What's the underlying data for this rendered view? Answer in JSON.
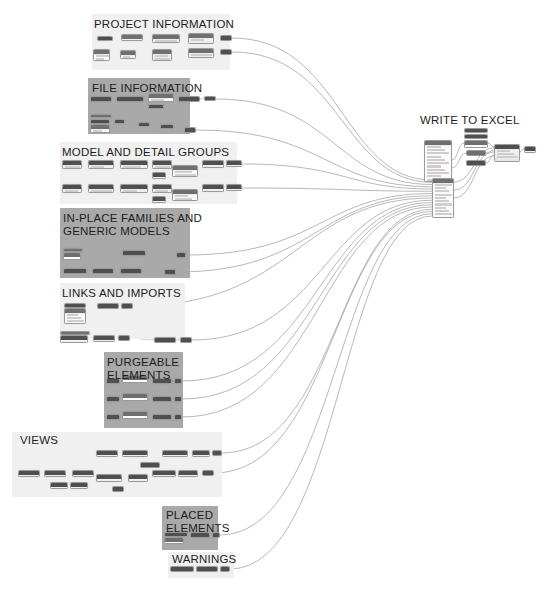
{
  "app": {
    "kind": "dynamo-visual-programming-graph",
    "canvas_width": 548,
    "canvas_height": 604,
    "background_color": "#ffffff",
    "wire_color": "#9a9a9a",
    "node_header_color": "#4f4f4f",
    "node_body_color": "#eceaea",
    "group_light_color": "#f0f0f0",
    "group_dark_color": "#a9a9a9",
    "title_color": "#1d1d1d"
  },
  "groups": [
    {
      "id": "project-information",
      "title": "PROJECT INFORMATION",
      "shade": "light",
      "x": 92,
      "y": 14,
      "w": 138,
      "h": 56,
      "title_x": 94,
      "title_y": 18
    },
    {
      "id": "file-information",
      "title": "FILE INFORMATION",
      "shade": "dark",
      "x": 88,
      "y": 78,
      "w": 102,
      "h": 56,
      "title_x": 92,
      "title_y": 82
    },
    {
      "id": "model-and-detail-groups",
      "title": "MODEL AND DETAIL GROUPS",
      "shade": "light",
      "x": 60,
      "y": 142,
      "w": 177,
      "h": 62,
      "title_x": 62,
      "title_y": 146
    },
    {
      "id": "in-place-families",
      "title": "IN-PLACE FAMILIES AND\nGENERIC MODELS",
      "shade": "dark",
      "x": 60,
      "y": 208,
      "w": 130,
      "h": 70,
      "title_x": 63,
      "title_y": 212
    },
    {
      "id": "links-and-imports",
      "title": "LINKS AND IMPORTS",
      "shade": "light",
      "x": 60,
      "y": 283,
      "w": 125,
      "h": 56,
      "title_x": 62,
      "title_y": 287
    },
    {
      "id": "purgeable-elements",
      "title": "PURGEABLE\nELEMENTS",
      "shade": "dark",
      "x": 104,
      "y": 352,
      "w": 79,
      "h": 76,
      "title_x": 107,
      "title_y": 356
    },
    {
      "id": "views",
      "title": "VIEWS",
      "shade": "light",
      "x": 12,
      "y": 432,
      "w": 210,
      "h": 65,
      "title_x": 20,
      "title_y": 434
    },
    {
      "id": "placed-elements",
      "title": "PLACED\nELEMENTS",
      "shade": "dark",
      "x": 162,
      "y": 506,
      "w": 56,
      "h": 44,
      "title_x": 166,
      "title_y": 509
    },
    {
      "id": "warnings",
      "title": "WARNINGS",
      "shade": "light",
      "x": 168,
      "y": 552,
      "w": 66,
      "h": 26,
      "title_x": 172,
      "title_y": 553
    },
    {
      "id": "write-to-excel",
      "title": "WRITE TO EXCEL",
      "shade": "none",
      "x": 418,
      "y": 112,
      "w": 120,
      "h": 96,
      "title_x": 420,
      "title_y": 114
    }
  ],
  "nodes": [
    {
      "g": "project-information",
      "x": 97,
      "y": 36,
      "w": 16,
      "h": 5,
      "k": "dark"
    },
    {
      "g": "project-information",
      "x": 121,
      "y": 34,
      "w": 22,
      "h": 7,
      "k": "std"
    },
    {
      "g": "project-information",
      "x": 152,
      "y": 34,
      "w": 28,
      "h": 9,
      "k": "std"
    },
    {
      "g": "project-information",
      "x": 188,
      "y": 33,
      "w": 26,
      "h": 11,
      "k": "std"
    },
    {
      "g": "project-information",
      "x": 220,
      "y": 35,
      "w": 12,
      "h": 6,
      "k": "dark"
    },
    {
      "g": "project-information",
      "x": 93,
      "y": 49,
      "w": 17,
      "h": 12,
      "k": "white"
    },
    {
      "g": "project-information",
      "x": 120,
      "y": 50,
      "w": 16,
      "h": 9,
      "k": "std"
    },
    {
      "g": "project-information",
      "x": 152,
      "y": 49,
      "w": 20,
      "h": 12,
      "k": "std"
    },
    {
      "g": "project-information",
      "x": 188,
      "y": 48,
      "w": 26,
      "h": 10,
      "k": "std"
    },
    {
      "g": "project-information",
      "x": 220,
      "y": 49,
      "w": 12,
      "h": 6,
      "k": "dark"
    },
    {
      "g": "file-information",
      "x": 90,
      "y": 96,
      "w": 22,
      "h": 6,
      "k": "dark"
    },
    {
      "g": "file-information",
      "x": 116,
      "y": 96,
      "w": 28,
      "h": 6,
      "k": "dark"
    },
    {
      "g": "file-information",
      "x": 148,
      "y": 93,
      "w": 26,
      "h": 9,
      "k": "white"
    },
    {
      "g": "file-information",
      "x": 148,
      "y": 104,
      "w": 16,
      "h": 5,
      "k": "dark"
    },
    {
      "g": "file-information",
      "x": 178,
      "y": 96,
      "w": 22,
      "h": 6,
      "k": "dark"
    },
    {
      "g": "file-information",
      "x": 204,
      "y": 96,
      "w": 12,
      "h": 5,
      "k": "dark"
    },
    {
      "g": "file-information",
      "x": 90,
      "y": 114,
      "w": 22,
      "h": 4,
      "k": "white"
    },
    {
      "g": "file-information",
      "x": 90,
      "y": 119,
      "w": 20,
      "h": 5,
      "k": "dark"
    },
    {
      "g": "file-information",
      "x": 90,
      "y": 124,
      "w": 20,
      "h": 9,
      "k": "white"
    },
    {
      "g": "file-information",
      "x": 114,
      "y": 119,
      "w": 11,
      "h": 5,
      "k": "dark"
    },
    {
      "g": "file-information",
      "x": 138,
      "y": 122,
      "w": 12,
      "h": 5,
      "k": "dark"
    },
    {
      "g": "file-information",
      "x": 160,
      "y": 124,
      "w": 14,
      "h": 5,
      "k": "dark"
    },
    {
      "g": "file-information",
      "x": 184,
      "y": 127,
      "w": 12,
      "h": 6,
      "k": "dark"
    },
    {
      "g": "model-and-detail-groups",
      "x": 62,
      "y": 160,
      "w": 20,
      "h": 9,
      "k": "dark"
    },
    {
      "g": "model-and-detail-groups",
      "x": 88,
      "y": 160,
      "w": 26,
      "h": 9,
      "k": "dark"
    },
    {
      "g": "model-and-detail-groups",
      "x": 120,
      "y": 160,
      "w": 28,
      "h": 9,
      "k": "dark"
    },
    {
      "g": "model-and-detail-groups",
      "x": 152,
      "y": 160,
      "w": 20,
      "h": 9,
      "k": "dark"
    },
    {
      "g": "model-and-detail-groups",
      "x": 152,
      "y": 172,
      "w": 14,
      "h": 7,
      "k": "dark"
    },
    {
      "g": "model-and-detail-groups",
      "x": 172,
      "y": 165,
      "w": 26,
      "h": 12,
      "k": "white"
    },
    {
      "g": "model-and-detail-groups",
      "x": 202,
      "y": 160,
      "w": 22,
      "h": 8,
      "k": "dark"
    },
    {
      "g": "model-and-detail-groups",
      "x": 226,
      "y": 160,
      "w": 16,
      "h": 7,
      "k": "dark"
    },
    {
      "g": "model-and-detail-groups",
      "x": 62,
      "y": 184,
      "w": 20,
      "h": 9,
      "k": "dark"
    },
    {
      "g": "model-and-detail-groups",
      "x": 88,
      "y": 184,
      "w": 26,
      "h": 9,
      "k": "dark"
    },
    {
      "g": "model-and-detail-groups",
      "x": 120,
      "y": 184,
      "w": 28,
      "h": 9,
      "k": "dark"
    },
    {
      "g": "model-and-detail-groups",
      "x": 152,
      "y": 184,
      "w": 20,
      "h": 9,
      "k": "dark"
    },
    {
      "g": "model-and-detail-groups",
      "x": 152,
      "y": 196,
      "w": 14,
      "h": 7,
      "k": "dark"
    },
    {
      "g": "model-and-detail-groups",
      "x": 172,
      "y": 189,
      "w": 26,
      "h": 12,
      "k": "white"
    },
    {
      "g": "model-and-detail-groups",
      "x": 202,
      "y": 184,
      "w": 22,
      "h": 8,
      "k": "dark"
    },
    {
      "g": "model-and-detail-groups",
      "x": 226,
      "y": 184,
      "w": 16,
      "h": 7,
      "k": "dark"
    },
    {
      "g": "in-place-families",
      "x": 63,
      "y": 248,
      "w": 20,
      "h": 4,
      "k": "white"
    },
    {
      "g": "in-place-families",
      "x": 63,
      "y": 252,
      "w": 18,
      "h": 8,
      "k": "white"
    },
    {
      "g": "in-place-families",
      "x": 122,
      "y": 250,
      "w": 24,
      "h": 6,
      "k": "dark"
    },
    {
      "g": "in-place-families",
      "x": 176,
      "y": 252,
      "w": 10,
      "h": 6,
      "k": "dark"
    },
    {
      "g": "in-place-families",
      "x": 63,
      "y": 268,
      "w": 24,
      "h": 6,
      "k": "dark"
    },
    {
      "g": "in-place-families",
      "x": 92,
      "y": 268,
      "w": 22,
      "h": 6,
      "k": "dark"
    },
    {
      "g": "in-place-families",
      "x": 120,
      "y": 268,
      "w": 22,
      "h": 6,
      "k": "dark"
    },
    {
      "g": "in-place-families",
      "x": 164,
      "y": 269,
      "w": 12,
      "h": 6,
      "k": "dark"
    },
    {
      "g": "links-and-imports",
      "x": 64,
      "y": 303,
      "w": 22,
      "h": 5,
      "k": "dark"
    },
    {
      "g": "links-and-imports",
      "x": 64,
      "y": 308,
      "w": 22,
      "h": 16,
      "k": "white"
    },
    {
      "g": "links-and-imports",
      "x": 97,
      "y": 303,
      "w": 22,
      "h": 6,
      "k": "dark"
    },
    {
      "g": "links-and-imports",
      "x": 121,
      "y": 303,
      "w": 12,
      "h": 6,
      "k": "dark"
    },
    {
      "g": "links-and-imports",
      "x": 60,
      "y": 331,
      "w": 30,
      "h": 4,
      "k": "white"
    },
    {
      "g": "links-and-imports",
      "x": 60,
      "y": 335,
      "w": 28,
      "h": 8,
      "k": "dark"
    },
    {
      "g": "links-and-imports",
      "x": 93,
      "y": 335,
      "w": 22,
      "h": 7,
      "k": "dark"
    },
    {
      "g": "links-and-imports",
      "x": 118,
      "y": 335,
      "w": 12,
      "h": 6,
      "k": "dark"
    },
    {
      "g": "links-and-imports",
      "x": 154,
      "y": 337,
      "w": 22,
      "h": 6,
      "k": "dark"
    },
    {
      "g": "links-and-imports",
      "x": 180,
      "y": 337,
      "w": 12,
      "h": 6,
      "k": "dark"
    },
    {
      "g": "purgeable-elements",
      "x": 106,
      "y": 378,
      "w": 14,
      "h": 6,
      "k": "dark"
    },
    {
      "g": "purgeable-elements",
      "x": 122,
      "y": 375,
      "w": 26,
      "h": 8,
      "k": "white"
    },
    {
      "g": "purgeable-elements",
      "x": 152,
      "y": 378,
      "w": 20,
      "h": 6,
      "k": "dark"
    },
    {
      "g": "purgeable-elements",
      "x": 174,
      "y": 378,
      "w": 8,
      "h": 6,
      "k": "dark"
    },
    {
      "g": "purgeable-elements",
      "x": 106,
      "y": 396,
      "w": 14,
      "h": 6,
      "k": "dark"
    },
    {
      "g": "purgeable-elements",
      "x": 122,
      "y": 393,
      "w": 26,
      "h": 8,
      "k": "white"
    },
    {
      "g": "purgeable-elements",
      "x": 152,
      "y": 396,
      "w": 20,
      "h": 6,
      "k": "dark"
    },
    {
      "g": "purgeable-elements",
      "x": 174,
      "y": 396,
      "w": 8,
      "h": 6,
      "k": "dark"
    },
    {
      "g": "purgeable-elements",
      "x": 106,
      "y": 414,
      "w": 14,
      "h": 6,
      "k": "dark"
    },
    {
      "g": "purgeable-elements",
      "x": 122,
      "y": 411,
      "w": 26,
      "h": 8,
      "k": "white"
    },
    {
      "g": "purgeable-elements",
      "x": 152,
      "y": 414,
      "w": 20,
      "h": 6,
      "k": "dark"
    },
    {
      "g": "purgeable-elements",
      "x": 174,
      "y": 414,
      "w": 8,
      "h": 6,
      "k": "dark"
    },
    {
      "g": "views",
      "x": 96,
      "y": 450,
      "w": 22,
      "h": 7,
      "k": "dark"
    },
    {
      "g": "views",
      "x": 122,
      "y": 450,
      "w": 26,
      "h": 7,
      "k": "dark"
    },
    {
      "g": "views",
      "x": 140,
      "y": 462,
      "w": 20,
      "h": 6,
      "k": "dark"
    },
    {
      "g": "views",
      "x": 162,
      "y": 450,
      "w": 26,
      "h": 7,
      "k": "dark"
    },
    {
      "g": "views",
      "x": 192,
      "y": 450,
      "w": 18,
      "h": 7,
      "k": "dark"
    },
    {
      "g": "views",
      "x": 212,
      "y": 450,
      "w": 10,
      "h": 6,
      "k": "dark"
    },
    {
      "g": "views",
      "x": 18,
      "y": 470,
      "w": 22,
      "h": 7,
      "k": "dark"
    },
    {
      "g": "views",
      "x": 44,
      "y": 470,
      "w": 22,
      "h": 7,
      "k": "dark"
    },
    {
      "g": "views",
      "x": 50,
      "y": 482,
      "w": 18,
      "h": 7,
      "k": "dark"
    },
    {
      "g": "views",
      "x": 70,
      "y": 482,
      "w": 18,
      "h": 7,
      "k": "dark"
    },
    {
      "g": "views",
      "x": 72,
      "y": 470,
      "w": 22,
      "h": 7,
      "k": "dark"
    },
    {
      "g": "views",
      "x": 96,
      "y": 474,
      "w": 26,
      "h": 8,
      "k": "dark"
    },
    {
      "g": "views",
      "x": 112,
      "y": 486,
      "w": 12,
      "h": 6,
      "k": "dark"
    },
    {
      "g": "views",
      "x": 128,
      "y": 474,
      "w": 20,
      "h": 8,
      "k": "dark"
    },
    {
      "g": "views",
      "x": 152,
      "y": 470,
      "w": 24,
      "h": 7,
      "k": "dark"
    },
    {
      "g": "views",
      "x": 178,
      "y": 470,
      "w": 20,
      "h": 7,
      "k": "dark"
    },
    {
      "g": "views",
      "x": 202,
      "y": 470,
      "w": 12,
      "h": 6,
      "k": "dark"
    },
    {
      "g": "placed-elements",
      "x": 164,
      "y": 532,
      "w": 24,
      "h": 5,
      "k": "dark"
    },
    {
      "g": "placed-elements",
      "x": 164,
      "y": 537,
      "w": 20,
      "h": 7,
      "k": "white"
    },
    {
      "g": "placed-elements",
      "x": 190,
      "y": 532,
      "w": 20,
      "h": 6,
      "k": "dark"
    },
    {
      "g": "placed-elements",
      "x": 212,
      "y": 532,
      "w": 8,
      "h": 6,
      "k": "dark"
    },
    {
      "g": "warnings",
      "x": 170,
      "y": 566,
      "w": 24,
      "h": 6,
      "k": "dark"
    },
    {
      "g": "warnings",
      "x": 196,
      "y": 566,
      "w": 22,
      "h": 6,
      "k": "dark"
    },
    {
      "g": "warnings",
      "x": 220,
      "y": 566,
      "w": 10,
      "h": 6,
      "k": "dark"
    },
    {
      "g": "write-to-excel",
      "x": 424,
      "y": 140,
      "w": 28,
      "h": 42,
      "k": "white"
    },
    {
      "g": "write-to-excel",
      "x": 464,
      "y": 128,
      "w": 24,
      "h": 5,
      "k": "dark"
    },
    {
      "g": "write-to-excel",
      "x": 464,
      "y": 134,
      "w": 24,
      "h": 5,
      "k": "dark"
    },
    {
      "g": "write-to-excel",
      "x": 464,
      "y": 140,
      "w": 24,
      "h": 8,
      "k": "white"
    },
    {
      "g": "write-to-excel",
      "x": 466,
      "y": 150,
      "w": 20,
      "h": 6,
      "k": "white"
    },
    {
      "g": "write-to-excel",
      "x": 466,
      "y": 160,
      "w": 20,
      "h": 6,
      "k": "dark"
    },
    {
      "g": "write-to-excel",
      "x": 494,
      "y": 144,
      "w": 26,
      "h": 18,
      "k": "dark"
    },
    {
      "g": "write-to-excel",
      "x": 524,
      "y": 146,
      "w": 12,
      "h": 7,
      "k": "dark"
    },
    {
      "g": "write-to-excel",
      "x": 432,
      "y": 178,
      "w": 22,
      "h": 40,
      "k": "white"
    }
  ],
  "hub": {
    "name": "list-create-node",
    "x": 432,
    "y": 178,
    "w": 22,
    "h": 40,
    "input_count": 18
  },
  "watermark": {
    "text": ""
  }
}
